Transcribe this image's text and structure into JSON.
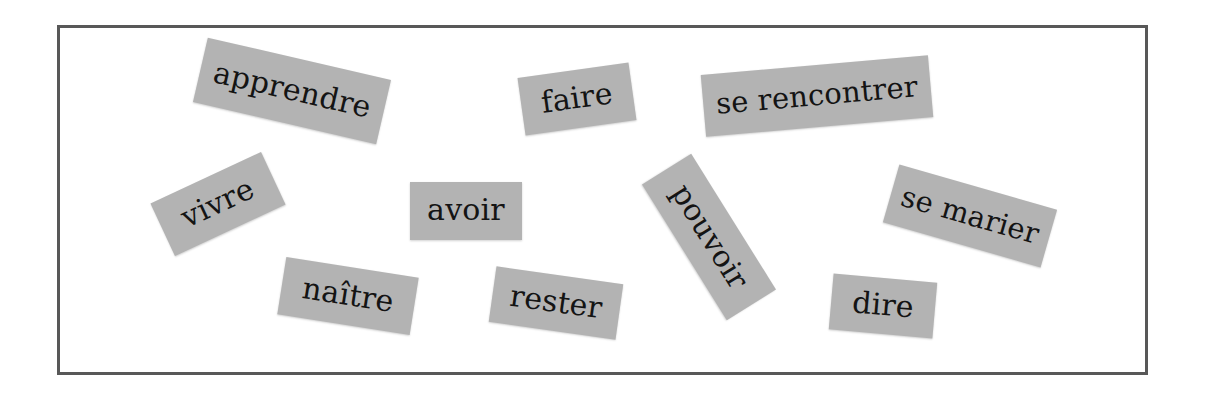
{
  "worksheet": {
    "background_color": "#ffffff",
    "frame": {
      "border_color": "#585858",
      "border_width_px": 3,
      "fill_color": "#ffffff"
    }
  },
  "cards": {
    "style": {
      "fill_color": "#b3b3b3",
      "text_color": "#141414"
    },
    "items": [
      {
        "id": "card-apprendre",
        "label": "apprendre",
        "left": 198,
        "top": 58,
        "width": 188,
        "height": 66,
        "rotation_deg": 13,
        "font_size": 30
      },
      {
        "id": "card-faire",
        "label": "faire",
        "left": 521,
        "top": 70,
        "width": 112,
        "height": 58,
        "rotation_deg": -8,
        "font_size": 30
      },
      {
        "id": "card-se-rencontrer",
        "label": "se rencontrer",
        "left": 703,
        "top": 65,
        "width": 228,
        "height": 62,
        "rotation_deg": -5,
        "font_size": 29
      },
      {
        "id": "card-vivre",
        "label": "vivre",
        "left": 157,
        "top": 175,
        "width": 122,
        "height": 58,
        "rotation_deg": -25,
        "font_size": 30
      },
      {
        "id": "card-avoir",
        "label": "avoir",
        "left": 410,
        "top": 182,
        "width": 112,
        "height": 58,
        "rotation_deg": 0,
        "font_size": 30
      },
      {
        "id": "card-pouvoir",
        "label": "pouvoir",
        "left": 629,
        "top": 208,
        "width": 160,
        "height": 58,
        "rotation_deg": 58,
        "font_size": 30
      },
      {
        "id": "card-se-marier",
        "label": "se marier",
        "left": 888,
        "top": 186,
        "width": 164,
        "height": 60,
        "rotation_deg": 16,
        "font_size": 29
      },
      {
        "id": "card-naitre",
        "label": "naître",
        "left": 281,
        "top": 267,
        "width": 134,
        "height": 58,
        "rotation_deg": 9,
        "font_size": 30
      },
      {
        "id": "card-rester",
        "label": "rester",
        "left": 492,
        "top": 275,
        "width": 128,
        "height": 56,
        "rotation_deg": 8,
        "font_size": 30
      },
      {
        "id": "card-dire",
        "label": "dire",
        "left": 831,
        "top": 278,
        "width": 104,
        "height": 56,
        "rotation_deg": 5,
        "font_size": 30
      }
    ]
  }
}
